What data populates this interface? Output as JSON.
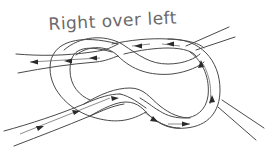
{
  "title": "Right over left",
  "diagram": {
    "ropes": [
      {
        "name": "static-rope",
        "from": "top-right",
        "to": "bottom-right",
        "has_flow_arrows": false
      },
      {
        "name": "working-rope",
        "from": "bottom-left",
        "to": "left",
        "has_flow_arrows": true
      }
    ],
    "flow_arrows": [
      {
        "segment": "bottom-left-end",
        "direction": "right"
      },
      {
        "segment": "lower-middle",
        "direction": "right"
      },
      {
        "segment": "lower-crossing",
        "direction": "right"
      },
      {
        "segment": "lower-right",
        "direction": "down-right"
      },
      {
        "segment": "bottom-loop",
        "direction": "right"
      },
      {
        "segment": "right-loop-lower",
        "direction": "up"
      },
      {
        "segment": "right-loop-upper",
        "direction": "up"
      },
      {
        "segment": "top-right",
        "direction": "left"
      },
      {
        "segment": "top-middle",
        "direction": "left"
      },
      {
        "segment": "left-upper",
        "direction": "left"
      },
      {
        "segment": "left-middle",
        "direction": "left"
      },
      {
        "segment": "left-end",
        "direction": "left"
      }
    ],
    "colors": {
      "background": "#ffffff",
      "line": "#4a4a4a",
      "caption": "#6a6a6a"
    }
  }
}
